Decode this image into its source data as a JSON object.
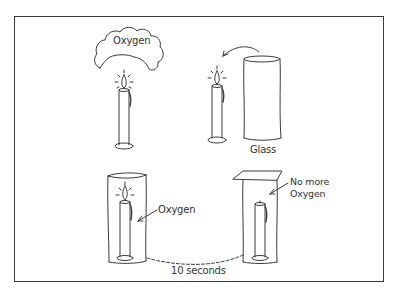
{
  "diagram": {
    "title": "",
    "panels": [
      {
        "id": "candle-with-oxygen",
        "position": "top-left",
        "elements": [
          "lit-candle",
          "oxygen-cloud"
        ],
        "labels": {
          "cloud": "Oxygen"
        }
      },
      {
        "id": "candle-and-glass",
        "position": "top-right",
        "elements": [
          "lit-candle",
          "glass",
          "curved-arrow"
        ],
        "labels": {
          "glass": "Glass"
        }
      },
      {
        "id": "glass-over-candle-burning",
        "position": "bottom-left",
        "elements": [
          "glass",
          "lit-candle",
          "arrow"
        ],
        "labels": {
          "inside": "Oxygen"
        }
      },
      {
        "id": "glass-over-candle-extinguished",
        "position": "bottom-right",
        "elements": [
          "glass-with-lid",
          "extinguished-candle",
          "arrow"
        ],
        "labels": {
          "inside_line1": "No more",
          "inside_line2": "Oxygen"
        }
      }
    ],
    "connector": {
      "style": "dashed",
      "from": "bottom-left",
      "to": "bottom-right",
      "label": "10 seconds"
    }
  },
  "colors": {
    "ink": "#3a3a3a",
    "background": "#ffffff"
  }
}
